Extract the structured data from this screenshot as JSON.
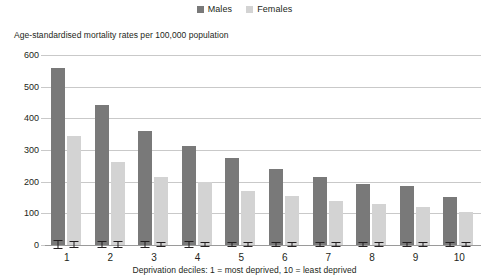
{
  "chart_data": {
    "type": "bar",
    "title": "",
    "subtitle": "Age-standardised mortality rates per 100,000 population",
    "xlabel": "Deprivation deciles: 1 = most deprived, 10 = least deprived",
    "ylabel": "Age-standardised mortality rates per 100,000 population",
    "categories": [
      "1",
      "2",
      "3",
      "4",
      "5",
      "6",
      "7",
      "8",
      "9",
      "10"
    ],
    "ylim": [
      0,
      600
    ],
    "yticks": [
      0,
      100,
      200,
      300,
      400,
      500,
      600
    ],
    "grid": true,
    "legend_position": "top-center",
    "error_bars": true,
    "series": [
      {
        "name": "Males",
        "color": "#797979",
        "values": [
          559,
          442,
          360,
          314,
          274,
          240,
          216,
          194,
          185,
          152
        ],
        "errors": [
          12,
          10,
          8,
          8,
          7,
          7,
          6,
          6,
          6,
          6
        ]
      },
      {
        "name": "Females",
        "color": "#d3d3d3",
        "values": [
          344,
          262,
          215,
          199,
          172,
          154,
          140,
          129,
          120,
          103
        ],
        "errors": [
          9,
          8,
          7,
          6,
          6,
          5,
          5,
          5,
          5,
          5
        ]
      }
    ]
  },
  "legend": {
    "items": [
      {
        "label": "Males",
        "color": "#797979"
      },
      {
        "label": "Females",
        "color": "#d3d3d3"
      }
    ]
  },
  "axes": {
    "y_note": "Age-standardised mortality rates per 100,000 population",
    "y_ticks": [
      "600",
      "500",
      "400",
      "300",
      "200",
      "100",
      "0"
    ],
    "x_ticks": [
      "1",
      "2",
      "3",
      "4",
      "5",
      "6",
      "7",
      "8",
      "9",
      "10"
    ],
    "x_title": "Deprivation deciles: 1 = most deprived, 10 = least deprived"
  }
}
